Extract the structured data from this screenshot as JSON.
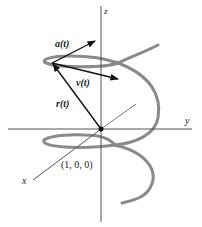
{
  "diagram": {
    "type": "3d-helix-vectors",
    "axes": {
      "x": "x",
      "y": "y",
      "z": "z"
    },
    "vectors": {
      "acceleration": "a(t)",
      "velocity": "v(t)",
      "position": "r(t)"
    },
    "point_label": "(1, 0, 0)",
    "colors": {
      "helix": "#8a8a8a",
      "axes": "#555555",
      "vectors": "#111111"
    }
  }
}
